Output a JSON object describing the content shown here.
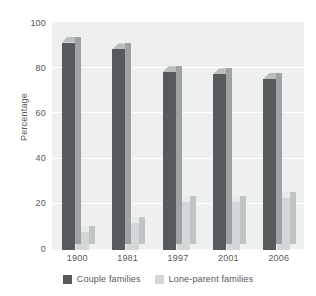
{
  "chart_data": {
    "type": "bar",
    "title": "",
    "xlabel": "",
    "ylabel": "Percentage",
    "categories": [
      "1900",
      "1981",
      "1997",
      "2001",
      "2006"
    ],
    "ylim": [
      0,
      100
    ],
    "yticks": [
      "0",
      "20",
      "40",
      "60",
      "80",
      "100"
    ],
    "grid": true,
    "legend_position": "bottom",
    "series": [
      {
        "name": "Couple families",
        "color": "#575a5c",
        "values": [
          91,
          88,
          78,
          77,
          75
        ]
      },
      {
        "name": "Lone-parent families",
        "color": "#d3d7d8",
        "values": [
          8,
          12,
          21,
          21,
          23
        ]
      }
    ]
  },
  "axes": {
    "y_title": "Percentage",
    "y_ticks": [
      {
        "label": "100",
        "value": 100
      },
      {
        "label": "80",
        "value": 80
      },
      {
        "label": "60",
        "value": 60
      },
      {
        "label": "40",
        "value": 40
      },
      {
        "label": "20",
        "value": 20
      },
      {
        "label": "0",
        "value": 0
      }
    ],
    "x_ticks": [
      "1900",
      "1981",
      "1997",
      "2001",
      "2006"
    ]
  },
  "legend": {
    "items": [
      {
        "label": "Couple families",
        "color": "#575a5c"
      },
      {
        "label": "Lone-parent families",
        "color": "#d3d7d8"
      }
    ]
  },
  "colors": {
    "plot_background": "#eef0f0",
    "gridline": "#ffffff",
    "text": "#58585a",
    "series_dark": "#575a5c",
    "series_light": "#d3d7d8"
  }
}
